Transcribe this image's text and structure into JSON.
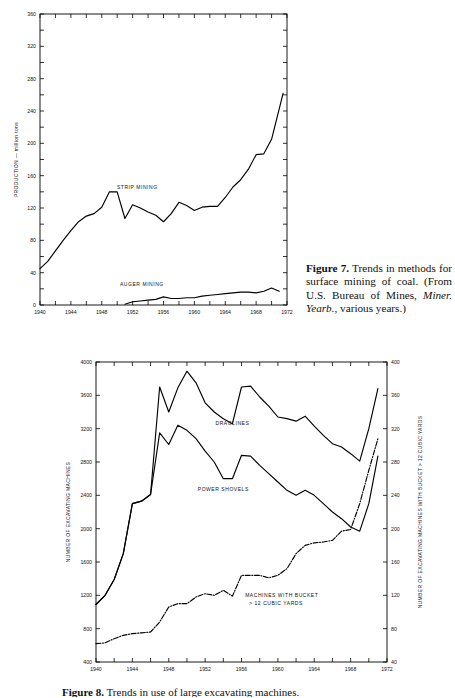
{
  "figure7": {
    "caption": {
      "number": "Figure 7.",
      "text_1": " Trends in methods for surface mining of coal. (From U.S. Bureau of Mines, ",
      "italic": "Miner. Yearb.",
      "text_2": ", various years.)"
    }
  },
  "figure8": {
    "caption": {
      "number": "Figure 8.",
      "text_1": "  Trends in use of large excavating machines."
    }
  },
  "chart_data": [
    {
      "id": "fig7",
      "type": "line",
      "title": "",
      "xlabel": "",
      "ylabel": "PRODUCTION — million tons",
      "xlim": [
        1940,
        1972
      ],
      "ylim": [
        0,
        360
      ],
      "xticks": [
        1940,
        1942,
        1944,
        1946,
        1948,
        1950,
        1952,
        1954,
        1956,
        1958,
        1960,
        1962,
        1964,
        1966,
        1968,
        1970,
        1972
      ],
      "xticklabels": [
        "1940",
        "",
        "1944",
        "",
        "1948",
        "",
        "1952",
        "",
        "1956",
        "",
        "1960",
        "",
        "1964",
        "",
        "1968",
        "",
        "1972"
      ],
      "yticks": [
        0,
        20,
        40,
        60,
        80,
        100,
        120,
        140,
        160,
        180,
        200,
        220,
        240,
        260,
        280,
        300,
        320,
        340,
        360
      ],
      "yticklabels": [
        "0",
        "",
        "40",
        "",
        "80",
        "",
        "120",
        "",
        "160",
        "",
        "200",
        "",
        "240",
        "",
        "280",
        "",
        "320",
        "",
        "360"
      ],
      "grid": false,
      "legend_position": "inline-annotation",
      "series": [
        {
          "name": "STRIP MINING",
          "style": "solid",
          "label_x": 1952.6,
          "label_y": 144,
          "x": [
            1940,
            1941,
            1942,
            1943,
            1944,
            1945,
            1946,
            1947,
            1948,
            1949,
            1950,
            1951,
            1952,
            1953,
            1954,
            1955,
            1956,
            1957,
            1958,
            1959,
            1960,
            1961,
            1962,
            1963,
            1964,
            1965,
            1966,
            1967,
            1968,
            1969,
            1970,
            1971
          ],
          "y": [
            45,
            54,
            67,
            80,
            92,
            103,
            110,
            113,
            121,
            140,
            140,
            107,
            124,
            120,
            115,
            111,
            103,
            113,
            127,
            123,
            117,
            121,
            122,
            122,
            133,
            146,
            155,
            168,
            186,
            187,
            205,
            243
          ]
        },
        {
          "name": "AUGER MINING",
          "style": "solid",
          "label_x": 1953.2,
          "label_y": 23,
          "x": [
            1951,
            1952,
            1953,
            1954,
            1955,
            1956,
            1957,
            1958,
            1959,
            1960,
            1961,
            1962,
            1963,
            1964,
            1965,
            1966,
            1967,
            1968,
            1969,
            1970,
            1971
          ],
          "y": [
            1,
            4,
            5,
            6,
            7,
            10,
            8,
            8,
            9,
            9,
            11,
            12,
            13,
            14,
            15,
            16,
            16,
            15,
            17,
            21,
            17
          ]
        }
      ],
      "strip_extra_x": [
        1971,
        1971.5
      ],
      "strip_extra_y": [
        243,
        262
      ]
    },
    {
      "id": "fig8",
      "type": "line",
      "title": "",
      "xlabel": "",
      "ylabel": "NUMBER OF EXCAVATING MACHINES",
      "y2label": "NUMBER OF EXCAVATING MACHINES WITH BUCKET > 12 CUBIC YARDS",
      "xlim": [
        1940,
        1972
      ],
      "ylim": [
        400,
        4000
      ],
      "y2lim": [
        40,
        400
      ],
      "xticks": [
        1940,
        1942,
        1944,
        1946,
        1948,
        1950,
        1952,
        1954,
        1956,
        1958,
        1960,
        1962,
        1964,
        1966,
        1968,
        1970,
        1972
      ],
      "xticklabels": [
        "1940",
        "",
        "1944",
        "",
        "1948",
        "",
        "1952",
        "",
        "1956",
        "",
        "1960",
        "",
        "1964",
        "",
        "1968",
        "",
        "1972"
      ],
      "yticks": [
        400,
        800,
        1200,
        1600,
        2000,
        2400,
        2800,
        3200,
        3600,
        4000
      ],
      "yticklabels": [
        "400",
        "800",
        "1200",
        "1600",
        "2000",
        "2400",
        "2800",
        "3200",
        "3600",
        "4000"
      ],
      "y2ticks": [
        40,
        80,
        120,
        160,
        200,
        240,
        280,
        320,
        360,
        400
      ],
      "y2ticklabels": [
        "40",
        "80",
        "120",
        "160",
        "200",
        "240",
        "280",
        "320",
        "360",
        "400"
      ],
      "grid": false,
      "legend_position": "inline-annotation",
      "series": [
        {
          "name": "DRAGLINES",
          "style": "solid",
          "axis": "left",
          "label_x": 1955.0,
          "label_y": 3240,
          "x": [
            1940,
            1941,
            1942,
            1943,
            1944,
            1945,
            1946,
            1947,
            1948,
            1949,
            1950,
            1951,
            1952,
            1953,
            1954,
            1955,
            1956,
            1957,
            1958,
            1959,
            1960,
            1961,
            1962,
            1963,
            1964,
            1965,
            1966,
            1967,
            1968,
            1969,
            1970,
            1971
          ],
          "y": [
            1090,
            1200,
            1390,
            1700,
            2300,
            2330,
            2410,
            3700,
            3400,
            3690,
            3890,
            3750,
            3510,
            3400,
            3320,
            3260,
            3700,
            3710,
            3580,
            3470,
            3340,
            3320,
            3290,
            3350,
            3230,
            3120,
            3020,
            2980,
            2900,
            2810,
            3200,
            3680
          ]
        },
        {
          "name": "POWER SHOVELS",
          "style": "solid",
          "axis": "left",
          "label_x": 1954.0,
          "label_y": 2450,
          "x": [
            1940,
            1941,
            1942,
            1943,
            1944,
            1945,
            1946,
            1947,
            1948,
            1949,
            1950,
            1951,
            1952,
            1953,
            1954,
            1955,
            1956,
            1957,
            1958,
            1959,
            1960,
            1961,
            1962,
            1963,
            1964,
            1965,
            1966,
            1967,
            1968,
            1969,
            1970,
            1971
          ],
          "y": [
            1090,
            1200,
            1390,
            1700,
            2300,
            2330,
            2410,
            3150,
            3010,
            3240,
            3180,
            3080,
            2930,
            2800,
            2600,
            2600,
            2880,
            2870,
            2760,
            2660,
            2560,
            2460,
            2400,
            2460,
            2400,
            2300,
            2200,
            2120,
            2020,
            1970,
            2300,
            2870
          ]
        },
        {
          "name": "MACHINES WITH BUCKET > 12 CUBIC YARDS",
          "style": "dashdot",
          "axis": "right",
          "label_x": 1956.4,
          "label_y_top": 1180,
          "label_y_bot": 1080,
          "x": [
            1940,
            1941,
            1942,
            1943,
            1944,
            1945,
            1946,
            1947,
            1948,
            1949,
            1950,
            1951,
            1952,
            1953,
            1954,
            1955,
            1956,
            1957,
            1958,
            1959,
            1960,
            1961,
            1962,
            1963,
            1964,
            1965,
            1966,
            1967,
            1968,
            1969,
            1970,
            1971
          ],
          "y": [
            62,
            63,
            68,
            72,
            74,
            75,
            76,
            88,
            106,
            110,
            110,
            118,
            122,
            120,
            126,
            119,
            144,
            144,
            144,
            141,
            144,
            152,
            170,
            180,
            183,
            184,
            186,
            197,
            199,
            230,
            270,
            308
          ]
        }
      ],
      "series_labels": {
        "bucket_line1": "MACHINES WITH BUCKET",
        "bucket_line2": "> 12 CUBIC YARDS"
      }
    }
  ]
}
